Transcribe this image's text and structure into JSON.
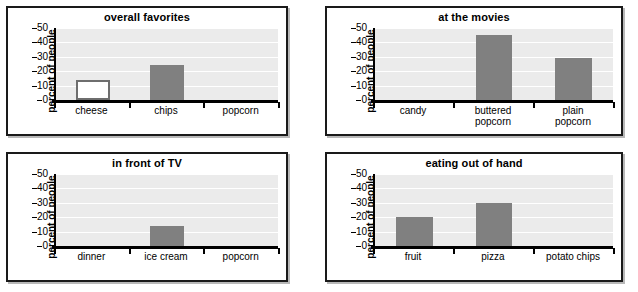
{
  "chart_data": [
    {
      "type": "bar",
      "title": "overall favorites",
      "xlabel": "",
      "ylabel": "percent of people",
      "categories": [
        "cheese",
        "chips",
        "popcorn"
      ],
      "values": [
        14,
        24,
        0
      ],
      "ylim": [
        0,
        50
      ],
      "yticks": [
        0,
        10,
        20,
        30,
        40,
        50
      ],
      "grid": true,
      "legend": "none",
      "bar_styles": [
        "hollow",
        "filled",
        "none"
      ]
    },
    {
      "type": "bar",
      "title": "at the movies",
      "xlabel": "",
      "ylabel": "percent of people",
      "categories": [
        "candy",
        "buttered\npopcorn",
        "plain\npopcorn"
      ],
      "values": [
        0,
        45,
        29
      ],
      "ylim": [
        0,
        50
      ],
      "yticks": [
        0,
        10,
        20,
        30,
        40,
        50
      ],
      "grid": true,
      "legend": "none",
      "bar_styles": [
        "none",
        "filled",
        "filled"
      ]
    },
    {
      "type": "bar",
      "title": "in front of TV",
      "xlabel": "",
      "ylabel": "percent of people",
      "categories": [
        "dinner",
        "ice cream",
        "popcorn"
      ],
      "values": [
        0,
        14,
        0
      ],
      "ylim": [
        0,
        50
      ],
      "yticks": [
        0,
        10,
        20,
        30,
        40,
        50
      ],
      "grid": true,
      "legend": "none",
      "bar_styles": [
        "none",
        "filled",
        "none"
      ]
    },
    {
      "type": "bar",
      "title": "eating out of hand",
      "xlabel": "",
      "ylabel": "percent of people",
      "categories": [
        "fruit",
        "pizza",
        "potato chips"
      ],
      "values": [
        20,
        30,
        0
      ],
      "ylim": [
        0,
        50
      ],
      "yticks": [
        0,
        10,
        20,
        30,
        40,
        50
      ],
      "grid": true,
      "legend": "none",
      "bar_styles": [
        "filled",
        "filled",
        "none"
      ]
    }
  ],
  "style": {
    "bar_fill": "#808080",
    "bar_outline": "#6e6e6e",
    "plot_background": "#ebebeb",
    "gridline_color": "#ffffff",
    "axis_color": "#000000",
    "panel_border": "#1a1a1a"
  }
}
